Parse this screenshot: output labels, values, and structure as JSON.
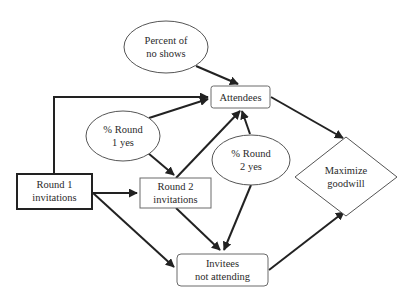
{
  "diagram": {
    "type": "influence-diagram",
    "nodes": [
      {
        "id": "no_shows",
        "shape": "ellipse",
        "lines": [
          "Percent of",
          "no shows"
        ]
      },
      {
        "id": "attendees",
        "shape": "rounded-rect",
        "lines": [
          "Attendees"
        ]
      },
      {
        "id": "r1_yes",
        "shape": "ellipse",
        "lines": [
          "% Round",
          "1 yes"
        ]
      },
      {
        "id": "r1_inv",
        "shape": "rect-thick",
        "lines": [
          "Round 1",
          "invitations"
        ]
      },
      {
        "id": "r2_inv",
        "shape": "rect",
        "lines": [
          "Round 2",
          "invitations"
        ]
      },
      {
        "id": "r2_yes",
        "shape": "ellipse",
        "lines": [
          "% Round",
          "2 yes"
        ]
      },
      {
        "id": "goodwill",
        "shape": "diamond",
        "lines": [
          "Maximize",
          "goodwill"
        ]
      },
      {
        "id": "not_attending",
        "shape": "rounded-rect",
        "lines": [
          "Invitees",
          "not attending"
        ]
      }
    ],
    "edges": [
      {
        "from": "no_shows",
        "to": "attendees"
      },
      {
        "from": "r1_inv",
        "to": "attendees"
      },
      {
        "from": "r1_yes",
        "to": "attendees"
      },
      {
        "from": "r1_yes",
        "to": "r2_inv"
      },
      {
        "from": "r1_inv",
        "to": "r2_inv"
      },
      {
        "from": "r2_inv",
        "to": "attendees"
      },
      {
        "from": "r2_yes",
        "to": "attendees"
      },
      {
        "from": "r1_inv",
        "to": "not_attending"
      },
      {
        "from": "r2_inv",
        "to": "not_attending"
      },
      {
        "from": "r2_yes",
        "to": "not_attending"
      },
      {
        "from": "attendees",
        "to": "goodwill"
      },
      {
        "from": "not_attending",
        "to": "goodwill"
      }
    ]
  },
  "labels": {
    "no_shows": {
      "l1": "Percent of",
      "l2": "no shows"
    },
    "attendees": {
      "l1": "Attendees"
    },
    "r1_yes": {
      "l1": "% Round",
      "l2": "1 yes"
    },
    "r1_inv": {
      "l1": "Round 1",
      "l2": "invitations"
    },
    "r2_inv": {
      "l1": "Round 2",
      "l2": "invitations"
    },
    "r2_yes": {
      "l1": "% Round",
      "l2": "2 yes"
    },
    "goodwill": {
      "l1": "Maximize",
      "l2": "goodwill"
    },
    "not_attending": {
      "l1": "Invitees",
      "l2": "not attending"
    }
  },
  "colors": {
    "edge": "#222222",
    "node_stroke": "#555555",
    "text": "#2a2a2a",
    "background": "#ffffff"
  }
}
